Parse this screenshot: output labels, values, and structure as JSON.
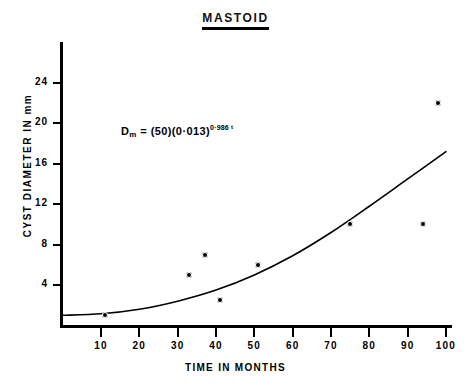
{
  "chart_data": {
    "type": "scatter",
    "title": "MASTOID",
    "xlabel": "TIME IN MONTHS",
    "ylabel": "CYST DIAMETER IN mm",
    "xlim": [
      0,
      102
    ],
    "ylim": [
      0,
      27
    ],
    "grid": false,
    "legend": null,
    "x_ticks": [
      10,
      20,
      30,
      40,
      50,
      60,
      70,
      80,
      90,
      100
    ],
    "x_tick_labels": [
      "10",
      "20",
      "30",
      "40",
      "50",
      "60",
      "70",
      "80",
      "90",
      "100"
    ],
    "y_ticks": [
      4,
      8,
      12,
      16,
      20,
      24
    ],
    "y_tick_labels": [
      "4",
      "8",
      "12",
      "16",
      "20",
      "24"
    ],
    "points": [
      {
        "x": 11,
        "y": 1.0
      },
      {
        "x": 33,
        "y": 5.0
      },
      {
        "x": 37,
        "y": 7.0
      },
      {
        "x": 41,
        "y": 2.5
      },
      {
        "x": 51,
        "y": 6.0
      },
      {
        "x": 75,
        "y": 10.0
      },
      {
        "x": 94,
        "y": 10.0
      },
      {
        "x": 98,
        "y": 22.0
      }
    ],
    "fit_curve": {
      "name": "fitted growth curve",
      "x": [
        0,
        10,
        20,
        30,
        40,
        50,
        60,
        70,
        80,
        90,
        100
      ],
      "y": [
        1.0,
        1.15,
        1.6,
        2.4,
        3.5,
        5.0,
        6.9,
        9.2,
        11.8,
        14.5,
        17.2
      ]
    },
    "annotations": [
      {
        "name": "model-equation",
        "parts": {
          "lhs_var": "D",
          "lhs_sub": "m",
          "equals": " = ",
          "factor_a": "(50)",
          "factor_b": "(0·013)",
          "exponent": "0·986",
          "exponent_var": "t"
        },
        "text": "D_m = (50)(0·013)^0·986 t",
        "x": 18,
        "y": 18.5
      }
    ]
  },
  "axis": {
    "y_title": "CYST DIAMETER IN mm",
    "x_title": "TIME IN MONTHS"
  },
  "style": {
    "ink": "#000000",
    "paper": "#ffffff"
  }
}
